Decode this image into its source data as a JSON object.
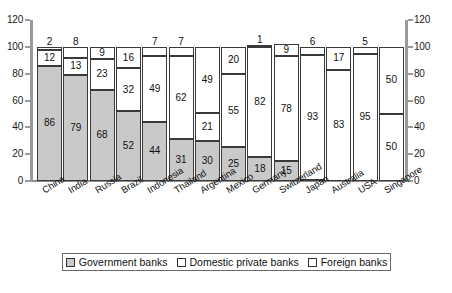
{
  "chart_data": {
    "type": "bar",
    "subtype": "stacked-percent",
    "title": "",
    "xlabel": "",
    "ylabel": "",
    "ylim": [
      0,
      120
    ],
    "yticks": [
      0,
      20,
      40,
      60,
      80,
      100,
      120
    ],
    "ytick_labels": [
      "0",
      "20",
      "40",
      "60",
      "80",
      "100",
      "120"
    ],
    "right_axis": true,
    "right_yticks": [
      0,
      20,
      40,
      60,
      80,
      100,
      120
    ],
    "right_ytick_labels": [
      "0",
      "20",
      "40",
      "60",
      "80",
      "100",
      "120"
    ],
    "grid": false,
    "legend_position": "bottom",
    "categories": [
      "China",
      "India",
      "Russia",
      "Brazil",
      "Indonesia",
      "Thailand",
      "Argentina",
      "Mexico",
      "Germany",
      "Switzerland",
      "Japan",
      "Australia",
      "USA",
      "Singapore"
    ],
    "series": [
      {
        "name": "Government banks",
        "values": [
          86,
          79,
          68,
          52,
          44,
          31,
          30,
          25,
          18,
          15,
          1,
          0,
          0,
          0
        ],
        "color": "#c9c9c9"
      },
      {
        "name": "Domestic private banks",
        "values": [
          12,
          13,
          23,
          32,
          49,
          62,
          21,
          55,
          82,
          78,
          93,
          83,
          95,
          50
        ],
        "color": "#ffffff"
      },
      {
        "name": "Foreign banks",
        "values": [
          2,
          8,
          9,
          16,
          7,
          7,
          49,
          20,
          1,
          9,
          6,
          17,
          5,
          50
        ],
        "color": "#ffffff"
      }
    ]
  },
  "legend": {
    "items": [
      {
        "label": "Government banks",
        "swatch": "gov-swatch"
      },
      {
        "label": "Domestic private banks",
        "swatch": "dom-swatch"
      },
      {
        "label": "Foreign banks",
        "swatch": "for-swatch"
      }
    ]
  },
  "caption": {
    "text": ""
  }
}
